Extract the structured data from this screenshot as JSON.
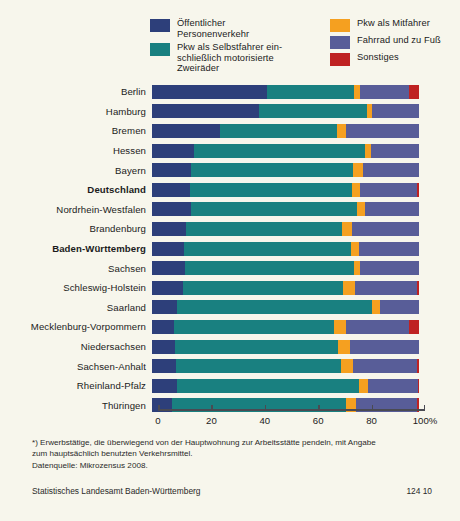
{
  "chart_data": {
    "type": "bar",
    "orientation": "horizontal",
    "stacked": true,
    "stacked_mode": "percent",
    "title": "",
    "xlabel": "",
    "ylabel": "",
    "xlim": [
      0,
      100
    ],
    "grid": false,
    "legend_position": "top",
    "axis_ticks": [
      0,
      20,
      40,
      60,
      80,
      100
    ],
    "axis_tick_labels": [
      "0",
      "20",
      "40",
      "60",
      "80",
      "100%"
    ],
    "categories": [
      "Berlin",
      "Hamburg",
      "Bremen",
      "Hessen",
      "Bayern",
      "Deutschland",
      "Nordrhein-Westfalen",
      "Brandenburg",
      "Baden-Württemberg",
      "Sachsen",
      "Schleswig-Holstein",
      "Saarland",
      "Mecklenburg-Vorpommern",
      "Niedersachsen",
      "Sachsen-Anhalt",
      "Rheinland-Pfalz",
      "Thüringen"
    ],
    "series": [
      {
        "name": "Öffentlicher Personenverkehr",
        "color": "#2d3f7a",
        "values": [
          43.0,
          40.0,
          25.5,
          15.8,
          14.5,
          14.2,
          14.6,
          12.8,
          12.0,
          12.3,
          11.5,
          9.4,
          8.4,
          8.6,
          9.0,
          9.4,
          7.5
        ]
      },
      {
        "name": "Pkw als Selbstfahrer einschließlich motorisierte Zweiräder",
        "color": "#198080",
        "values": [
          32.6,
          40.4,
          43.8,
          64.0,
          60.7,
          60.7,
          62.2,
          58.4,
          62.5,
          63.3,
          59.9,
          73.0,
          59.9,
          61.0,
          61.8,
          68.2,
          65.2
        ]
      },
      {
        "name": "Pkw als Mitfahrer",
        "color": "#f5a020",
        "values": [
          2.2,
          1.9,
          3.4,
          2.2,
          3.7,
          3.0,
          3.0,
          3.7,
          3.0,
          2.2,
          4.5,
          3.0,
          4.5,
          4.5,
          4.5,
          3.4,
          3.7
        ]
      },
      {
        "name": "Fahrrad und zu Fuß",
        "color": "#585d98",
        "values": [
          18.4,
          17.7,
          27.3,
          18.0,
          21.1,
          21.3,
          20.2,
          25.1,
          22.5,
          22.2,
          23.2,
          14.6,
          23.6,
          25.9,
          23.9,
          18.6,
          23.0
        ]
      },
      {
        "name": "Sonstiges",
        "color": "#bf2222",
        "values": [
          3.8,
          0.0,
          0.0,
          0.0,
          0.0,
          0.8,
          0.0,
          0.0,
          0.0,
          0.0,
          0.9,
          0.0,
          3.6,
          0.0,
          0.8,
          0.4,
          0.6
        ]
      }
    ],
    "bold_categories": [
      "Deutschland",
      "Baden-Württemberg"
    ]
  },
  "legend": {
    "left_column": [
      {
        "label": "Öffentlicher\nPersonenverkehr",
        "color": "#2d3f7a"
      },
      {
        "label": "Pkw als Selbstfahrer ein-\nschließlich motorisierte\nZweiräder",
        "color": "#198080"
      }
    ],
    "right_column": [
      {
        "label": "Pkw als Mitfahrer",
        "color": "#f5a020"
      },
      {
        "label": "Fahrrad und zu Fuß",
        "color": "#585d98"
      },
      {
        "label": "Sonstiges",
        "color": "#bf2222"
      }
    ]
  },
  "footnote": {
    "line1": "*) Erwerbstätige, die überwiegend von der Hauptwohnung zur Arbeitsstätte pendeln, mit Angabe",
    "line2": "zum hauptsächlich benutzten Verkehrsmittel.",
    "line3": "Datenquelle: Mikrozensus 2008."
  },
  "source": {
    "institution": "Statistisches Landesamt Baden-Württemberg",
    "code": "124 10"
  },
  "colors": {
    "background": "#f7f6ec",
    "axis": "#4a4a52",
    "text": "#1b1b1b"
  }
}
